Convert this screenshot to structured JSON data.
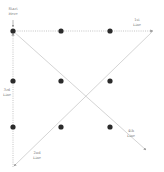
{
  "diagram": {
    "colors": {
      "dot": "#2b2b2b",
      "line": "#b5b5b5",
      "label": "#777777"
    },
    "dots": [
      {
        "x": 13,
        "y": 31
      },
      {
        "x": 61,
        "y": 31
      },
      {
        "x": 110,
        "y": 31
      },
      {
        "x": 13,
        "y": 81
      },
      {
        "x": 61,
        "y": 81
      },
      {
        "x": 110,
        "y": 81
      },
      {
        "x": 13,
        "y": 127
      },
      {
        "x": 61,
        "y": 127
      },
      {
        "x": 110,
        "y": 127
      }
    ],
    "start": {
      "line1": "Start",
      "line2": "Here"
    },
    "lines": [
      {
        "id": "1st",
        "label1": "1st",
        "label2": "Line"
      },
      {
        "id": "2nd",
        "label1": "2nd",
        "label2": "Line"
      },
      {
        "id": "3rd",
        "label1": "3rd",
        "label2": "Line"
      },
      {
        "id": "4th",
        "label1": "4th",
        "label2": "Line"
      }
    ]
  }
}
